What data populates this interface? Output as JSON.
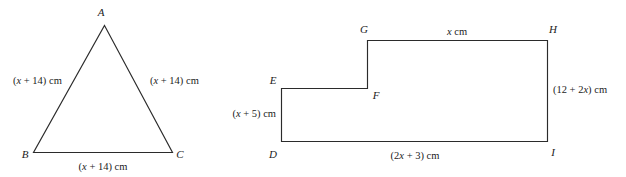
{
  "figure": {
    "stroke_color": "#2b2b2b",
    "text_color": "#1c1c1c",
    "background": "#ffffff"
  },
  "triangle": {
    "name": "triangle-abc",
    "vertices": {
      "a": "A",
      "b": "B",
      "c": "C"
    },
    "sides": {
      "left": "(x + 14) cm",
      "right": "(x + 14) cm",
      "bottom": "(x + 14) cm"
    },
    "side_parts": {
      "left_open": "(",
      "left_var": "x",
      "left_rest": " + 14) cm",
      "right_open": "(",
      "right_var": "x",
      "right_rest": " + 14) cm",
      "bottom_open": "(",
      "bottom_var": "x",
      "bottom_rest": " + 14) cm"
    }
  },
  "polygon": {
    "name": "step-polygon-defghi",
    "vertices": {
      "d": "D",
      "e": "E",
      "f": "F",
      "g": "G",
      "h": "H",
      "i": "I"
    },
    "sides": {
      "top_gh": "x cm",
      "right_hi": "(12 + 2x) cm",
      "bottom_di": "(2x + 3) cm",
      "left_de": "(x + 5) cm"
    },
    "side_parts": {
      "top_var": "x",
      "top_rest": " cm",
      "right_open": "(12 + 2",
      "right_var": "x",
      "right_rest": ") cm",
      "bottom_open": "(2",
      "bottom_var": "x",
      "bottom_rest": " + 3) cm",
      "left_open": "(",
      "left_var": "x",
      "left_rest": " + 5) cm"
    }
  }
}
